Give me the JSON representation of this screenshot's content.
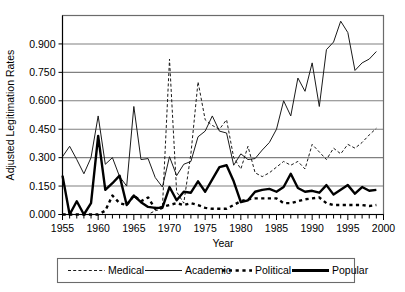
{
  "chart_data": {
    "type": "line",
    "title": "",
    "xlabel": "Year",
    "ylabel": "Adjusted Legitimation Rates",
    "xlim": [
      1955,
      2000
    ],
    "ylim": [
      0.0,
      1.05
    ],
    "grid": true,
    "legend_position": "bottom",
    "y_ticks": [
      "0.000",
      "0.150",
      "0.300",
      "0.450",
      "0.600",
      "0.750",
      "0.900"
    ],
    "y_tick_values": [
      0.0,
      0.15,
      0.3,
      0.45,
      0.6,
      0.75,
      0.9
    ],
    "x_ticks": [
      "1955",
      "1960",
      "1965",
      "1970",
      "1975",
      "1980",
      "1985",
      "1990",
      "1995",
      "2000"
    ],
    "x_tick_values": [
      1955,
      1960,
      1965,
      1970,
      1975,
      1980,
      1985,
      1990,
      1995,
      2000
    ],
    "x": [
      1955,
      1956,
      1957,
      1958,
      1959,
      1960,
      1961,
      1962,
      1963,
      1964,
      1965,
      1966,
      1967,
      1968,
      1969,
      1970,
      1971,
      1972,
      1973,
      1974,
      1975,
      1976,
      1977,
      1978,
      1979,
      1980,
      1981,
      1982,
      1983,
      1984,
      1985,
      1986,
      1987,
      1988,
      1989,
      1990,
      1991,
      1992,
      1993,
      1994,
      1995,
      1996,
      1997,
      1998,
      1999
    ],
    "series": [
      {
        "name": "Medical",
        "style": "fine-dashed",
        "values": [
          0.0,
          0.0,
          0.0,
          0.0,
          0.0,
          0.0,
          0.0,
          0.0,
          0.0,
          0.0,
          0.0,
          0.0,
          0.0,
          0.02,
          0.03,
          0.82,
          0.12,
          0.06,
          0.32,
          0.7,
          0.5,
          0.47,
          0.45,
          0.5,
          0.3,
          0.24,
          0.36,
          0.22,
          0.2,
          0.22,
          0.25,
          0.28,
          0.26,
          0.28,
          0.24,
          0.37,
          0.33,
          0.29,
          0.35,
          0.32,
          0.37,
          0.35,
          0.38,
          0.42,
          0.455
        ]
      },
      {
        "name": "Academic",
        "style": "thin-solid",
        "values": [
          0.305,
          0.36,
          0.29,
          0.215,
          0.3,
          0.52,
          0.265,
          0.3,
          0.2,
          0.15,
          0.57,
          0.29,
          0.295,
          0.195,
          0.145,
          0.305,
          0.205,
          0.265,
          0.28,
          0.41,
          0.44,
          0.52,
          0.44,
          0.43,
          0.26,
          0.32,
          0.29,
          0.295,
          0.34,
          0.38,
          0.45,
          0.6,
          0.52,
          0.72,
          0.65,
          0.8,
          0.57,
          0.87,
          0.91,
          1.02,
          0.96,
          0.76,
          0.8,
          0.82,
          0.86
        ]
      },
      {
        "name": "Political",
        "style": "thick-dotted",
        "values": [
          0.0,
          0.0,
          0.0,
          0.0,
          0.0,
          0.0,
          0.02,
          0.1,
          0.06,
          0.05,
          0.1,
          0.07,
          0.09,
          0.03,
          0.04,
          0.05,
          0.06,
          0.05,
          0.06,
          0.05,
          0.035,
          0.03,
          0.03,
          0.03,
          0.05,
          0.07,
          0.08,
          0.085,
          0.085,
          0.085,
          0.085,
          0.06,
          0.06,
          0.07,
          0.08,
          0.085,
          0.09,
          0.06,
          0.05,
          0.05,
          0.05,
          0.05,
          0.05,
          0.045,
          0.05
        ]
      },
      {
        "name": "Popular",
        "style": "thick-solid",
        "values": [
          0.205,
          0.0,
          0.07,
          0.0,
          0.06,
          0.415,
          0.13,
          0.165,
          0.205,
          0.05,
          0.1,
          0.065,
          0.04,
          0.035,
          0.035,
          0.145,
          0.075,
          0.12,
          0.115,
          0.175,
          0.12,
          0.185,
          0.25,
          0.26,
          0.175,
          0.065,
          0.075,
          0.12,
          0.13,
          0.135,
          0.12,
          0.145,
          0.215,
          0.14,
          0.12,
          0.125,
          0.115,
          0.155,
          0.105,
          0.13,
          0.155,
          0.11,
          0.145,
          0.125,
          0.13
        ]
      }
    ]
  },
  "legend": {
    "items": [
      {
        "label": "Medical"
      },
      {
        "label": "Academic"
      },
      {
        "label": "Political"
      },
      {
        "label": "Popular"
      }
    ]
  },
  "colors": {
    "line": "#1a1a1a",
    "grid": "#808080",
    "frame": "#6b6b6b",
    "background": "#ffffff"
  }
}
